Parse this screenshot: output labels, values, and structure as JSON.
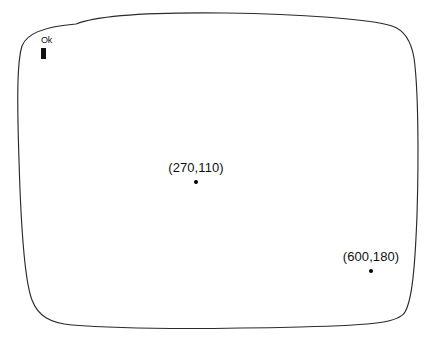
{
  "diagram": {
    "bezel": {
      "shape": "rounded-rectangle-outline",
      "stroke_color": "#2b2b2b",
      "fill_color": "#ffffff",
      "stroke_width": 1
    },
    "prompt": {
      "text": "Ok",
      "cursor": "block-cursor",
      "cursor_color": "#111111"
    },
    "points": [
      {
        "id": "point-a",
        "label": "(270,110)",
        "x": 270,
        "y": 110,
        "marker": "dot",
        "marker_color": "#000000"
      },
      {
        "id": "point-b",
        "label": "(600,180)",
        "x": 600,
        "y": 180,
        "marker": "dot",
        "marker_color": "#000000"
      }
    ]
  }
}
